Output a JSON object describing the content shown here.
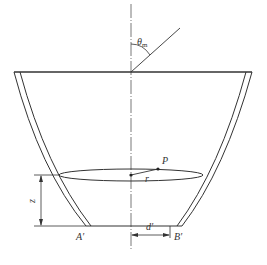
{
  "figure": {
    "labels": {
      "theta": "θ",
      "theta_sub": "m",
      "point_p": "P",
      "radius": "r",
      "height": "z",
      "base_left": "A′",
      "base_right": "B′",
      "distance": "d′"
    },
    "colors": {
      "line": "#333333",
      "axis": "#555555",
      "background": "#ffffff"
    }
  }
}
